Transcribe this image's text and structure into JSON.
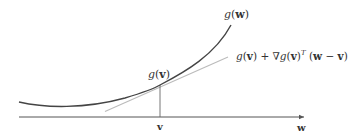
{
  "figure": {
    "type": "diagram",
    "labels": {
      "curve": "g(w)",
      "tangent_point": "g(v)",
      "tangent_line": "g(v) + ∇g(v)ᵀ (w − v)",
      "axis_point": "v",
      "axis": "w"
    },
    "colors": {
      "curve": "#444444",
      "tangent": "#b8b8b8",
      "axis": "#555555",
      "guide": "#666666",
      "text": "#333333"
    }
  }
}
